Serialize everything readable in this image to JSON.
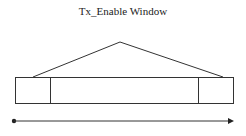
{
  "diagram": {
    "title": "Tx_Enable Window",
    "stroke_color": "#333333",
    "segments": [
      {
        "name": "left-guard",
        "x1": 15,
        "x2": 50
      },
      {
        "name": "center-window",
        "x1": 50,
        "x2": 198
      },
      {
        "name": "right-guard",
        "x1": 198,
        "x2": 233
      }
    ],
    "ramp": {
      "start": [
        33,
        77
      ],
      "apex": [
        120,
        42
      ],
      "end": [
        223,
        77
      ]
    },
    "time_axis": {
      "start": [
        14,
        121
      ],
      "end": [
        233,
        121
      ]
    }
  }
}
